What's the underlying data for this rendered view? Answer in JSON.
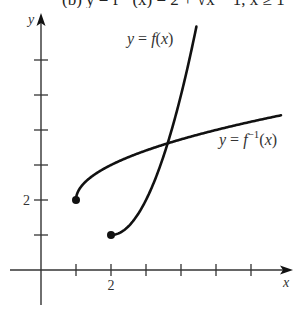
{
  "cut_text": "(b) y = f⁻¹(x) = 2 + √x − 1, x ≥ 1",
  "chart_data": {
    "type": "line",
    "title": "",
    "xlabel": "x",
    "ylabel": "y",
    "x_tick_labels": {
      "2": "2"
    },
    "y_tick_labels": {
      "2": "2"
    },
    "x_ticks": [
      1,
      2,
      3,
      4,
      5,
      6
    ],
    "y_ticks": [
      1,
      2,
      3,
      4,
      5,
      6
    ],
    "xlim": [
      -0.9,
      7.2
    ],
    "ylim": [
      -1,
      7.2
    ],
    "grid": false,
    "series": [
      {
        "name": "y = f(x)",
        "label_parts": {
          "pre": "y = ",
          "fn": "f",
          "post": "(x)"
        },
        "formula": "1 + (x - 2)^2, x >= 2",
        "start_point": [
          2,
          1
        ],
        "endpoint_marker": "filled-circle",
        "x": [
          2,
          2.5,
          3,
          3.5,
          4,
          4.4
        ],
        "y": [
          1,
          1.25,
          2,
          3.25,
          5,
          6.76
        ]
      },
      {
        "name": "y = f^-1(x)",
        "label_parts": {
          "pre": "y = ",
          "fn": "f",
          "sup": "−1",
          "post": "(x)"
        },
        "formula": "2 + sqrt(x - 1), x >= 1",
        "start_point": [
          1,
          2
        ],
        "endpoint_marker": "filled-circle",
        "x": [
          1,
          1.25,
          2,
          3,
          4,
          5,
          6,
          6.9
        ],
        "y": [
          2,
          2.5,
          3,
          3.41,
          3.73,
          4,
          4.24,
          4.43
        ]
      }
    ],
    "intersection": [
      3.6,
      3.6
    ],
    "colors": {
      "curve": "#111111",
      "axis": "#333333",
      "text": "#333333"
    }
  }
}
